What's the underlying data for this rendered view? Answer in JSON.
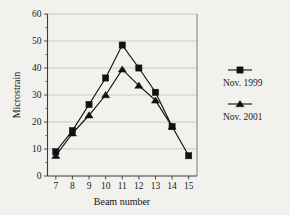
{
  "chart_data": {
    "type": "line",
    "title": "",
    "xlabel": "Beam number",
    "ylabel": "Microstrain",
    "x": [
      7,
      8,
      9,
      10,
      11,
      12,
      13,
      14,
      15
    ],
    "categories": [
      "7",
      "8",
      "9",
      "10",
      "11",
      "12",
      "13",
      "14",
      "15"
    ],
    "xlim": [
      6.5,
      15.5
    ],
    "ylim": [
      0,
      60
    ],
    "yticks": [
      0,
      10,
      20,
      30,
      40,
      50,
      60
    ],
    "ytick_labels": [
      "0",
      "10",
      "20",
      "30",
      "40",
      "50",
      "60"
    ],
    "yminor_ticks": [
      5,
      15,
      25,
      35,
      45,
      55
    ],
    "xtick_labels": [
      "7",
      "8",
      "9",
      "10",
      "11",
      "12",
      "13",
      "14",
      "15"
    ],
    "grid": "horizontal",
    "legend_position": "right-outside",
    "series": [
      {
        "name": "Nov. 1999",
        "marker": "square",
        "color": "#111111",
        "x": [
          7,
          8,
          9,
          10,
          11,
          12,
          13,
          14,
          15
        ],
        "values": [
          9.0,
          16.8,
          26.5,
          36.3,
          48.5,
          40.0,
          31.0,
          18.3,
          7.5
        ]
      },
      {
        "name": "Nov. 2001",
        "marker": "triangle",
        "color": "#111111",
        "x": [
          7,
          8,
          9,
          10,
          11,
          12,
          13,
          14
        ],
        "values": [
          7.5,
          15.8,
          22.5,
          30.0,
          39.5,
          33.5,
          28.0,
          18.3
        ]
      }
    ]
  },
  "legend": {
    "items": [
      {
        "label": "Nov. 1999",
        "marker": "square-marker"
      },
      {
        "label": "Nov. 2001",
        "marker": "triangle-marker"
      }
    ]
  },
  "axes": {
    "x_title": "Beam number",
    "y_title": "Microstrain"
  }
}
